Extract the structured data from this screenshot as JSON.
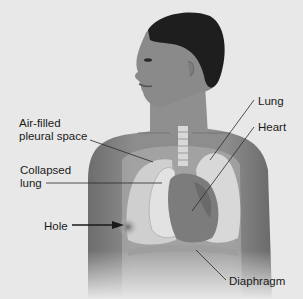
{
  "diagram": {
    "labels": {
      "air_filled_line1": "Air-filled",
      "air_filled_line2": "pleural space",
      "collapsed_line1": "Collapsed",
      "collapsed_line2": "lung",
      "hole": "Hole",
      "lung": "Lung",
      "heart": "Heart",
      "diaphragm": "Diaphragm"
    },
    "colors": {
      "background": "#e8e8e8",
      "skin": "#8a8a8a",
      "hair": "#1e1e1e",
      "lung": "#d4d4d4",
      "heart": "#7a7a7a",
      "leader_line": "#2a2a2a"
    }
  }
}
